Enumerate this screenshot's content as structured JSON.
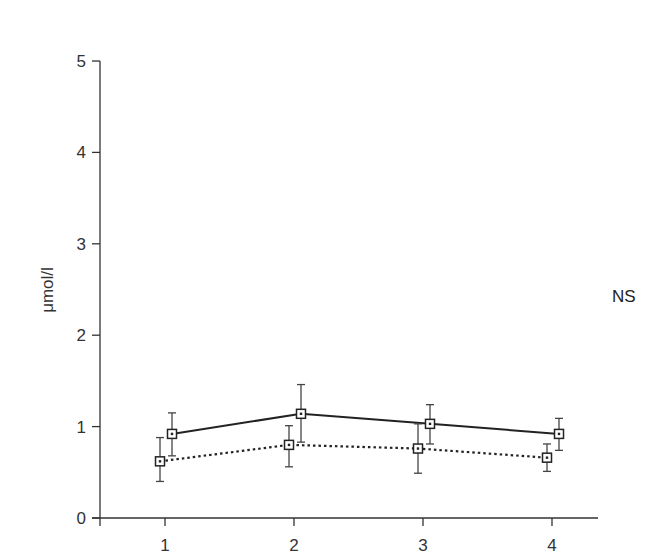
{
  "chart_data": {
    "type": "line",
    "title": "",
    "xlabel": "",
    "ylabel": "μmol/l",
    "x": [
      1,
      2,
      3,
      4
    ],
    "xticks": [
      "1",
      "2",
      "3",
      "4"
    ],
    "yticks": [
      "0",
      "1",
      "2",
      "3",
      "4",
      "5"
    ],
    "ylim": [
      0,
      5
    ],
    "xlim": [
      0.5,
      4.85
    ],
    "grid": false,
    "legend": null,
    "annotations": [
      {
        "text": "NS",
        "position": "right-middle"
      }
    ],
    "series": [
      {
        "name": "solid",
        "line_style": "solid",
        "marker": "square",
        "color": "#222222",
        "values": [
          0.92,
          1.14,
          1.03,
          0.92
        ],
        "error_upper": [
          1.15,
          1.46,
          1.24,
          1.09
        ],
        "error_lower": [
          0.68,
          0.83,
          0.81,
          0.74
        ]
      },
      {
        "name": "dotted",
        "line_style": "dotted",
        "marker": "square",
        "color": "#222222",
        "values": [
          0.62,
          0.8,
          0.76,
          0.66
        ],
        "error_upper": [
          0.88,
          1.01,
          1.03,
          0.81
        ],
        "error_lower": [
          0.4,
          0.56,
          0.49,
          0.51
        ]
      }
    ]
  }
}
